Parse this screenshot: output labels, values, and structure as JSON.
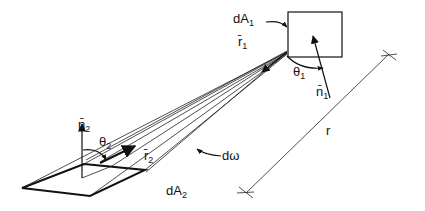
{
  "figure": {
    "labels": {
      "dA1": {
        "main": "dA",
        "sub": "1"
      },
      "dA2": {
        "main": "dA",
        "sub": "2"
      },
      "r1": {
        "main": "r̄",
        "sub": "1"
      },
      "r2": {
        "main": "r̄",
        "sub": "2"
      },
      "n1": {
        "main": "n̄",
        "sub": "1"
      },
      "n2": {
        "main": "n̄",
        "sub": "2"
      },
      "theta1": {
        "main": "θ",
        "sub": "1"
      },
      "theta2": {
        "main": "θ",
        "sub": "2"
      },
      "domega": "dω",
      "r": "r"
    },
    "colors": {
      "stroke": "#111111",
      "background": "#ffffff"
    }
  }
}
